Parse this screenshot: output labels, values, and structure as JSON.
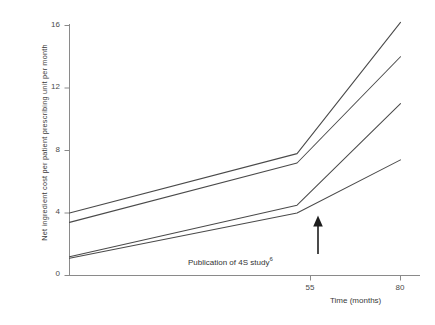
{
  "chart_data": {
    "type": "line",
    "title": "",
    "xlabel": "Time (months)",
    "ylabel": "Net ingredient cost per patient prescribing unit per month",
    "xlim": [
      0,
      80
    ],
    "ylim": [
      0,
      16
    ],
    "xticks": [
      55,
      80
    ],
    "xticklabels": [
      "55",
      "80"
    ],
    "yticks": [
      0,
      4,
      8,
      12,
      16
    ],
    "yticklabels": [
      "0",
      "4",
      "8",
      "12",
      "16"
    ],
    "grid": false,
    "legend": null,
    "annotations": [
      {
        "text": "Publication of 4S study",
        "superscript": "6",
        "x": 55,
        "y": 0,
        "arrow": "up",
        "points_to_y": 4.0
      }
    ],
    "series": [
      {
        "name": "series-1",
        "x": [
          0,
          55,
          80
        ],
        "y": [
          4.0,
          7.8,
          16.2
        ]
      },
      {
        "name": "series-2",
        "x": [
          0,
          55,
          80
        ],
        "y": [
          3.4,
          7.2,
          14.0
        ]
      },
      {
        "name": "series-3",
        "x": [
          0,
          55,
          80
        ],
        "y": [
          1.2,
          4.5,
          11.0
        ]
      },
      {
        "name": "series-4",
        "x": [
          0,
          55,
          80
        ],
        "y": [
          1.1,
          4.0,
          7.4
        ]
      }
    ]
  },
  "axes": {
    "y_tick_labels": [
      "16",
      "12",
      "8",
      "4",
      "0"
    ],
    "x_tick_labels": [
      "55",
      "80"
    ],
    "x_axis_title": "Time (months)",
    "y_axis_title": "Net ingredient cost per patient prescribing unit per month"
  },
  "annotation": {
    "label": "Publication of 4S study",
    "superscript": "6"
  },
  "style": {
    "line_color": "#4a4a4a",
    "axis_color": "#7a7a7a",
    "text_color": "#333333",
    "background": "#ffffff"
  }
}
